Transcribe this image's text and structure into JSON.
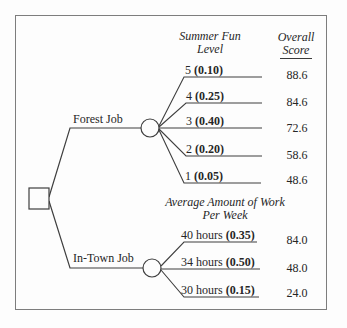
{
  "headers": {
    "fun_line1": "Summer Fun",
    "fun_line2": "Level",
    "score_line1": "Overall",
    "score_line2": "Score",
    "work_line1": "Average Amount of Work",
    "work_line2": "Per Week"
  },
  "nodes": {
    "decision_shape": "square",
    "chance_shape": "circle"
  },
  "branches": {
    "forest": {
      "label": "Forest Job",
      "outcomes": [
        {
          "level": "5",
          "prob": "(0.10)",
          "score": "88.6"
        },
        {
          "level": "4",
          "prob": "(0.25)",
          "score": "84.6"
        },
        {
          "level": "3",
          "prob": "(0.40)",
          "score": "72.6"
        },
        {
          "level": "2",
          "prob": "(0.20)",
          "score": "58.6"
        },
        {
          "level": "1",
          "prob": "(0.05)",
          "score": "48.6"
        }
      ]
    },
    "intown": {
      "label": "In-Town Job",
      "outcomes": [
        {
          "level": "40 hours",
          "prob": "(0.35)",
          "score": "84.0"
        },
        {
          "level": "34 hours",
          "prob": "(0.50)",
          "score": "48.0"
        },
        {
          "level": "30 hours",
          "prob": "(0.15)",
          "score": "24.0"
        }
      ]
    }
  },
  "colors": {
    "line": "#3f3f3f",
    "text": "#262626",
    "frame": "#7d7d7d",
    "background": "#fdfdfd"
  }
}
